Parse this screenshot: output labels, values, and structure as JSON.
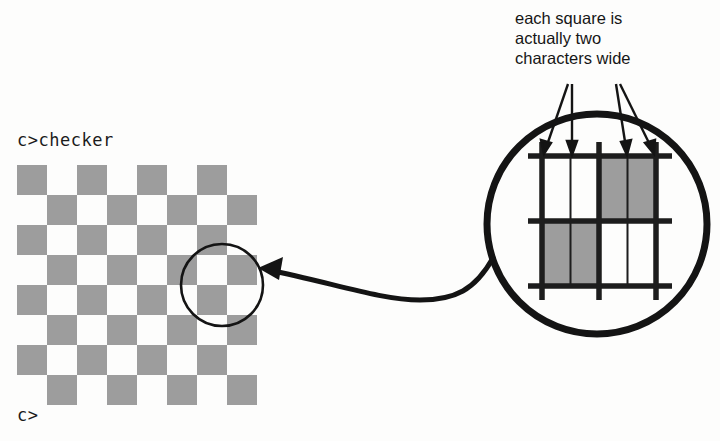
{
  "figure": {
    "background_color": "#fdfdfc",
    "ink_color": "#161616",
    "square_gray": "#9d9d9d"
  },
  "terminal": {
    "prompt_command": "c>checker",
    "prompt_empty": "c>"
  },
  "caption": {
    "line1": "each square is",
    "line2": "actually two",
    "line3": "characters wide"
  },
  "checkerboard": {
    "columns": 8,
    "rows": 8,
    "cell_size_px": 30,
    "pattern": [
      [
        1,
        0,
        1,
        0,
        1,
        0,
        1,
        0
      ],
      [
        0,
        1,
        0,
        1,
        0,
        1,
        0,
        1
      ],
      [
        1,
        0,
        1,
        0,
        1,
        0,
        1,
        0
      ],
      [
        0,
        1,
        0,
        1,
        0,
        1,
        0,
        1
      ],
      [
        1,
        0,
        1,
        0,
        1,
        0,
        1,
        0
      ],
      [
        0,
        1,
        0,
        1,
        0,
        1,
        0,
        1
      ],
      [
        1,
        0,
        1,
        0,
        1,
        0,
        1,
        0
      ],
      [
        0,
        1,
        0,
        1,
        0,
        1,
        0,
        1
      ]
    ]
  },
  "magnifier": {
    "detail_cells": [
      [
        0,
        1
      ],
      [
        1,
        0
      ]
    ],
    "characters_per_square": 2,
    "arrow_count": 4
  }
}
